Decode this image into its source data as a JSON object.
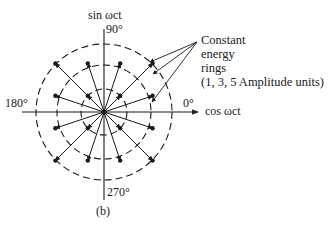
{
  "diagram": {
    "type": "16-QAM constellation (polar plot)",
    "caption": "(b)",
    "axes": {
      "y_label": "sin ωct",
      "x_label": "cos ωct",
      "angle_labels": {
        "top": "90°",
        "left": "180°",
        "right": "0°",
        "bottom": "270°"
      }
    },
    "annotation": {
      "lines": [
        "Constant",
        "energy",
        "rings",
        "(1, 3, 5 Amplitude units)"
      ]
    },
    "rings": [
      {
        "name": "inner",
        "radius_px": 23
      },
      {
        "name": "middle",
        "radius_px": 47
      },
      {
        "name": "outer",
        "radius_px": 68
      }
    ],
    "points": [
      [
        1,
        1
      ],
      [
        1,
        3
      ],
      [
        3,
        1
      ],
      [
        3,
        3
      ],
      [
        -1,
        1
      ],
      [
        -1,
        3
      ],
      [
        -3,
        1
      ],
      [
        -3,
        3
      ],
      [
        -1,
        -1
      ],
      [
        -1,
        -3
      ],
      [
        -3,
        -1
      ],
      [
        -3,
        -3
      ],
      [
        1,
        -1
      ],
      [
        1,
        -3
      ],
      [
        3,
        -1
      ],
      [
        3,
        -3
      ]
    ],
    "colors": {
      "ink": "#1a1a1a",
      "background": "#ffffff"
    }
  }
}
